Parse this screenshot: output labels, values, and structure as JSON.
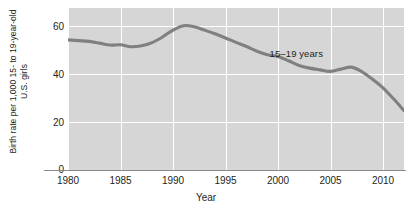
{
  "chart_data": {
    "type": "line",
    "title": "",
    "xlabel": "Year",
    "ylabel_line1": "Birth rate per 1,000 15- to 19-year-old",
    "ylabel_line2": "U.S. girls",
    "xlim": [
      1980,
      2012
    ],
    "ylim": [
      0,
      66
    ],
    "xticks": [
      1980,
      1985,
      1990,
      1995,
      2000,
      2005,
      2010
    ],
    "yticks": [
      0,
      20,
      40,
      60
    ],
    "grid": true,
    "legend": "none",
    "annotations": [
      {
        "text": "15–19 years",
        "x": 1999.2,
        "y": 47.5
      }
    ],
    "series": [
      {
        "name": "15–19 years",
        "color": "#808080",
        "x": [
          1980,
          1981,
          1982,
          1983,
          1984,
          1985,
          1986,
          1987,
          1988,
          1989,
          1990,
          1991,
          1992,
          1993,
          1994,
          1995,
          1996,
          1997,
          1998,
          1999,
          2000,
          2001,
          2002,
          2003,
          2004,
          2005,
          2006,
          2007,
          2008,
          2009,
          2010,
          2011,
          2012
        ],
        "values": [
          53.0,
          52.7,
          52.4,
          51.7,
          50.9,
          51.0,
          50.2,
          50.6,
          51.9,
          54.2,
          57.0,
          58.8,
          58.4,
          57.0,
          55.5,
          53.8,
          52.0,
          50.3,
          48.4,
          47.0,
          46.2,
          44.5,
          42.6,
          41.5,
          40.8,
          40.2,
          41.1,
          41.9,
          40.0,
          37.0,
          33.5,
          29.0,
          24.2
        ]
      }
    ]
  }
}
